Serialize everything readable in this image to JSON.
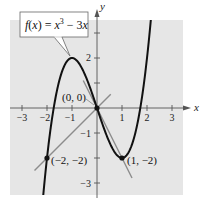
{
  "chart_data": {
    "type": "line",
    "title": "",
    "xlabel": "x",
    "ylabel": "y",
    "xlim": [
      -3.5,
      3.4
    ],
    "ylim": [
      -3.5,
      3.5
    ],
    "xticks": [
      -3,
      -2,
      -1,
      1,
      2,
      3
    ],
    "yticks": [
      -3,
      -2,
      -1,
      1,
      2,
      3
    ],
    "xtick_labels": [
      "-3",
      "-2",
      "-1",
      "1",
      "2",
      "3"
    ],
    "ytick_labels_shown": {
      "2": "2",
      "-1": "-1",
      "-3": "-3"
    },
    "grid": false,
    "series": [
      {
        "name": "f(x) = x^3 - 3x",
        "kind": "curve",
        "formula": "x^3 - 3x",
        "x_range": [
          -2.2,
          2.2
        ],
        "color": "#111111"
      },
      {
        "name": "line through (-2,-2) and (0,0)",
        "kind": "line",
        "slope": 1,
        "intercept": 0,
        "x_range": [
          -2.5,
          0.55
        ],
        "color": "#8a8a8a"
      },
      {
        "name": "line through (0,0) and (1,-2)",
        "kind": "line",
        "slope": -2,
        "intercept": 0,
        "x_range": [
          -0.55,
          1.4
        ],
        "color": "#8a8a8a"
      }
    ],
    "points": [
      {
        "x": 0,
        "y": 0,
        "label": "(0, 0)"
      },
      {
        "x": -2,
        "y": -2,
        "label": "(−2, −2)"
      },
      {
        "x": 1,
        "y": -2,
        "label": "(1, −2)"
      }
    ],
    "annotations": [
      {
        "text": "f(x) = x³ − 3x",
        "points_to": {
          "x": -1,
          "y": 2
        }
      }
    ]
  },
  "labels": {
    "x_axis": "x",
    "y_axis": "y",
    "fn_f": "f",
    "fn_open": "(",
    "fn_x": "x",
    "fn_close": ") = ",
    "fn_x2": "x",
    "fn_exp": "3",
    "fn_rest": " − 3",
    "fn_x3": "x",
    "tick_x_m3": "−3",
    "tick_x_m2": "−2",
    "tick_x_m1": "−1",
    "tick_x_1": "1",
    "tick_x_2": "2",
    "tick_x_3": "3",
    "tick_y_2": "2",
    "tick_y_m1": "−1",
    "tick_y_m3": "−3",
    "pt_origin": "(0, 0)",
    "pt_m2m2": "(−2, −2)",
    "pt_1m2": "(1, −2)"
  },
  "colors": {
    "panel": "#e6e6e6",
    "curve": "#111111",
    "tangent": "#8c8c8c",
    "axis": "#555555"
  }
}
